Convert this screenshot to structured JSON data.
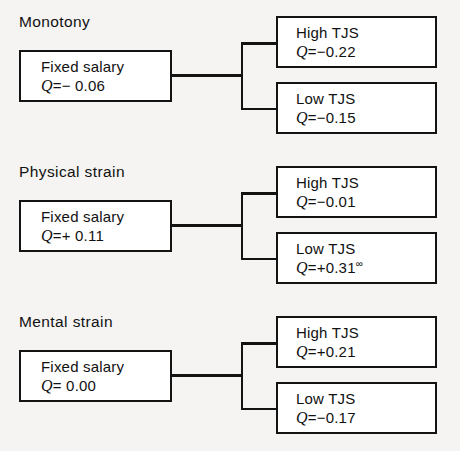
{
  "figure": {
    "type": "tree-diagram",
    "background_color": "#f5f4f2",
    "line_color": "#131313",
    "box_fill": "#ffffff",
    "groups": [
      {
        "title": "Monotony",
        "root": {
          "label": "Fixed salary",
          "q_symbol": "Q",
          "q_text": "=− 0.06",
          "q_value": -0.06
        },
        "branches": [
          {
            "label": "High TJS",
            "q_symbol": "Q",
            "q_text": "=−0.22",
            "q_value": -0.22,
            "marker": ""
          },
          {
            "label": "Low TJS",
            "q_symbol": "Q",
            "q_text": "=−0.15",
            "q_value": -0.15,
            "marker": ""
          }
        ]
      },
      {
        "title": "Physical strain",
        "root": {
          "label": "Fixed salary",
          "q_symbol": "Q",
          "q_text": "=+ 0.11",
          "q_value": 0.11
        },
        "branches": [
          {
            "label": "High TJS",
            "q_symbol": "Q",
            "q_text": "=−0.01",
            "q_value": -0.01,
            "marker": ""
          },
          {
            "label": "Low TJS",
            "q_symbol": "Q",
            "q_text": "=+0.31",
            "q_value": 0.31,
            "marker": "∞"
          }
        ]
      },
      {
        "title": "Mental strain",
        "root": {
          "label": "Fixed salary",
          "q_symbol": "Q",
          "q_text": "= 0.00",
          "q_value": 0.0
        },
        "branches": [
          {
            "label": "High TJS",
            "q_symbol": "Q",
            "q_text": "=+0.21",
            "q_value": 0.21,
            "marker": ""
          },
          {
            "label": "Low TJS",
            "q_symbol": "Q",
            "q_text": "=−0.17",
            "q_value": -0.17,
            "marker": ""
          }
        ]
      }
    ]
  }
}
